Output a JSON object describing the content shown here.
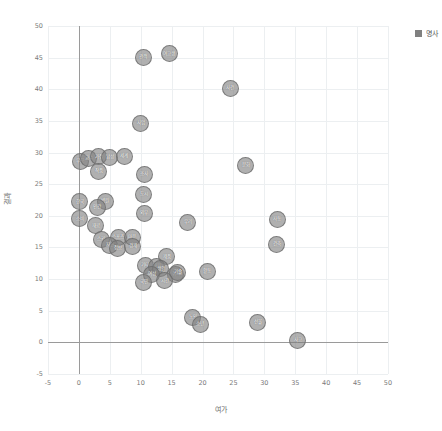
{
  "legend": {
    "label": "명사",
    "swatch_color": "#808080",
    "position": "top-right"
  },
  "axis_titles": {
    "x": "여가",
    "y": "결과"
  },
  "chart_data": {
    "type": "scatter",
    "title": "",
    "xlabel": "여가",
    "ylabel": "결과",
    "xlim": [
      -5,
      50
    ],
    "ylim": [
      -5,
      50
    ],
    "xticks": [
      -5,
      0,
      5,
      10,
      15,
      20,
      25,
      30,
      35,
      40,
      45,
      50
    ],
    "yticks": [
      -5,
      0,
      5,
      10,
      15,
      20,
      25,
      30,
      35,
      40,
      45,
      50
    ],
    "grid": true,
    "legend_position": "top-right",
    "marker_color": "#808080",
    "series": [
      {
        "name": "명사",
        "points": [
          {
            "label": "관객",
            "x": 10.4,
            "y": 45.0
          },
          {
            "label": "여고생",
            "x": 14.6,
            "y": 45.6
          },
          {
            "label": "사건",
            "x": 24.5,
            "y": 40.2
          },
          {
            "label": "사업",
            "x": 10.0,
            "y": 34.6
          },
          {
            "label": "부모",
            "x": 0.2,
            "y": 28.6
          },
          {
            "label": "교수",
            "x": 1.6,
            "y": 29.1
          },
          {
            "label": "가정",
            "x": 3.2,
            "y": 29.3
          },
          {
            "label": "남성",
            "x": 5.0,
            "y": 29.2
          },
          {
            "label": "세계",
            "x": 7.3,
            "y": 29.4
          },
          {
            "label": "작품",
            "x": 3.2,
            "y": 27.0
          },
          {
            "label": "문화",
            "x": 27.0,
            "y": 28.0
          },
          {
            "label": "조사",
            "x": 10.6,
            "y": 26.5
          },
          {
            "label": "도시",
            "x": 10.5,
            "y": 23.4
          },
          {
            "label": "한국",
            "x": 0.1,
            "y": 22.2
          },
          {
            "label": "병원",
            "x": 4.3,
            "y": 22.3
          },
          {
            "label": "인간",
            "x": 3.0,
            "y": 21.3
          },
          {
            "label": "외부",
            "x": 10.6,
            "y": 20.4
          },
          {
            "label": "소비",
            "x": 0.1,
            "y": 19.5
          },
          {
            "label": "우리",
            "x": 17.6,
            "y": 19.0
          },
          {
            "label": "자동",
            "x": 32.1,
            "y": 19.4
          },
          {
            "label": "재료",
            "x": 2.7,
            "y": 18.4
          },
          {
            "label": "스키",
            "x": 3.6,
            "y": 16.3
          },
          {
            "label": "스포츠",
            "x": 6.4,
            "y": 16.6
          },
          {
            "label": "마음",
            "x": 8.6,
            "y": 16.6
          },
          {
            "label": "자신",
            "x": 5.0,
            "y": 15.3
          },
          {
            "label": "정보",
            "x": 6.3,
            "y": 14.8
          },
          {
            "label": "경제",
            "x": 8.7,
            "y": 15.2
          },
          {
            "label": "건축",
            "x": 32.0,
            "y": 15.5
          },
          {
            "label": "제품",
            "x": 14.2,
            "y": 13.5
          },
          {
            "label": "기타",
            "x": 10.7,
            "y": 12.2
          },
          {
            "label": "내용",
            "x": 12.6,
            "y": 12.0
          },
          {
            "label": "생활",
            "x": 13.2,
            "y": 11.6
          },
          {
            "label": "여성",
            "x": 11.8,
            "y": 10.8
          },
          {
            "label": "취미",
            "x": 15.7,
            "y": 10.8
          },
          {
            "label": "활동",
            "x": 20.8,
            "y": 11.2
          },
          {
            "label": "기술",
            "x": 16.0,
            "y": 11.0
          },
          {
            "label": "국민",
            "x": 10.5,
            "y": 9.5
          },
          {
            "label": "시간",
            "x": 13.9,
            "y": 9.7
          },
          {
            "label": "노인",
            "x": 18.4,
            "y": 3.9
          },
          {
            "label": "소년",
            "x": 19.6,
            "y": 2.9
          },
          {
            "label": "선물",
            "x": 28.9,
            "y": 3.1
          },
          {
            "label": "사고",
            "x": 35.4,
            "y": 0.3
          }
        ]
      }
    ]
  }
}
